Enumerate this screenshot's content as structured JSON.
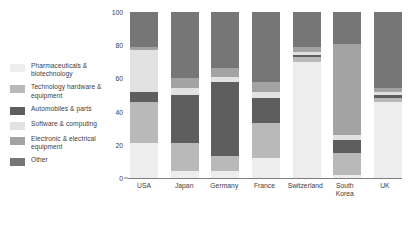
{
  "chart_data": {
    "type": "bar",
    "subtype": "stacked-bar-100",
    "title": "",
    "xlabel": "",
    "ylabel": "",
    "ylim": [
      0,
      100
    ],
    "yticks": [
      0,
      20,
      40,
      60,
      80,
      100
    ],
    "grid": false,
    "legend_position": "left",
    "categories": [
      "USA",
      "Japan",
      "Germany",
      "France",
      "Switzerland",
      "South Korea",
      "UK"
    ],
    "series": [
      {
        "name": "Pharmaceuticals & biotechnology",
        "color": "#ededed",
        "values": [
          21,
          4,
          4,
          12,
          70,
          2,
          46
        ]
      },
      {
        "name": "Technology hardware & equipment",
        "color": "#b9b9b9",
        "values": [
          25,
          17,
          9,
          21,
          3,
          13,
          2
        ]
      },
      {
        "name": "Automobiles & parts",
        "color": "#5e5e5e",
        "values": [
          6,
          29,
          45,
          15,
          1,
          8,
          2
        ]
      },
      {
        "name": "Software & computing",
        "color": "#e2e2e2",
        "values": [
          25,
          4,
          3,
          4,
          2,
          3,
          2
        ]
      },
      {
        "name": "Electronic & electrical equipment",
        "color": "#a3a3a3",
        "values": [
          2,
          6,
          5,
          6,
          3,
          55,
          2
        ]
      },
      {
        "name": "Other",
        "color": "#767676",
        "values": [
          21,
          40,
          34,
          42,
          21,
          19,
          46
        ]
      }
    ]
  },
  "legend": {
    "items": [
      {
        "label": "Pharmaceuticals & biotechnology",
        "color": "#ededed"
      },
      {
        "label": "Technology hardware & equipment",
        "color": "#b9b9b9"
      },
      {
        "label": "Automobiles & parts",
        "color": "#5e5e5e"
      },
      {
        "label": "Software & computing",
        "color": "#e2e2e2"
      },
      {
        "label": "Electronic & electrical equipment",
        "color": "#a3a3a3"
      },
      {
        "label": "Other",
        "color": "#767676"
      }
    ]
  }
}
